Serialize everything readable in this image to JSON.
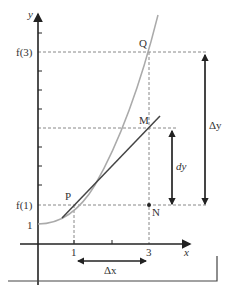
{
  "diagram": {
    "axes": {
      "y_label": "y",
      "x_label": "x",
      "y_tick_f3": "f(3)",
      "y_tick_f1": "f(1)",
      "y_tick_1": "1",
      "x_tick_1": "1",
      "x_tick_3": "3"
    },
    "points": {
      "P": "P",
      "Q": "Q",
      "M": "M",
      "N": "N"
    },
    "annotations": {
      "delta_x": "Δx",
      "delta_y": "Δy",
      "dy": "dy"
    },
    "colors": {
      "curve": "#aaaaaa",
      "tangent": "#444444",
      "axis": "#222222",
      "dashed": "#888888"
    }
  }
}
